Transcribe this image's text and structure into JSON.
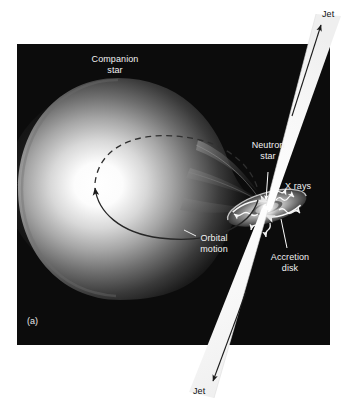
{
  "figure": {
    "panel_tag": "(a)",
    "background_color": "#ffffff",
    "panel_color": "#0a0a0a",
    "panel_rect": {
      "x": 17,
      "y": 44,
      "width": 313,
      "height": 301
    }
  },
  "labels": {
    "companion_star": "Companion\nstar",
    "neutron_star": "Neutron\nstar",
    "x_rays": "X rays",
    "accretion_disk": "Accretion\ndisk",
    "orbital_motion": "Orbital\nmotion",
    "jet_top": "Jet",
    "jet_bottom": "Jet"
  },
  "colors": {
    "label_light": "#f2f2f2",
    "label_dark": "#111111",
    "jet_beam": "#f6f6f6",
    "star_core": "#ffffff",
    "star_mid": "#9a9a9a",
    "star_edge": "#141414",
    "disk_bright": "#ffffff",
    "disk_body": "#b9b9b9",
    "orbit_line": "#2b2b2b",
    "arrow_white": "#ffffff",
    "arrow_dark": "#1a1a1a"
  },
  "elements": {
    "companion_star_name": "companion-star",
    "accretion_disk_name": "accretion-disk",
    "neutron_star_name": "neutron-star",
    "jet_upper_name": "jet-upper-beam",
    "jet_lower_name": "jet-lower-beam",
    "orbit_path_name": "orbital-motion-path",
    "accretion_stream_name": "accretion-stream",
    "xray_rays_name": "x-ray-wavy-arrows"
  }
}
